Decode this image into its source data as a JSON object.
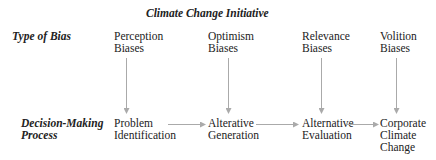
{
  "title": "Climate Change Initiative",
  "rows": {
    "bias_label": "Type of Bias",
    "process_label_line1": "Decision-Making",
    "process_label_line2": "Process"
  },
  "biases": [
    {
      "line1": "Perception",
      "line2": "Biases"
    },
    {
      "line1": "Optimism",
      "line2": "Biases"
    },
    {
      "line1": "Relevance",
      "line2": "Biases"
    },
    {
      "line1": "Volition",
      "line2": "Biases"
    }
  ],
  "steps": [
    {
      "line1": "Problem",
      "line2": "Identification",
      "line3": ""
    },
    {
      "line1": "Alterative",
      "line2": "Generation",
      "line3": ""
    },
    {
      "line1": "Alternative",
      "line2": "Evaluation",
      "line3": ""
    },
    {
      "line1": "Corporate",
      "line2": "Climate",
      "line3": "Change"
    }
  ],
  "colors": {
    "arrow": "#aaaaaa",
    "text": "#222222"
  }
}
